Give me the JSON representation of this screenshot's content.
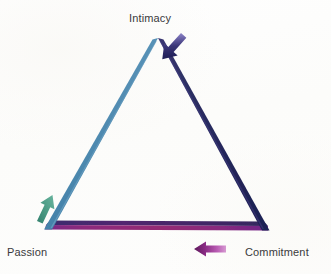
{
  "figure": {
    "background_color": "#fdfdfc",
    "label_color": "#3a3a3c"
  },
  "vertices": {
    "apex": {
      "label": "Intimacy",
      "x": 158,
      "y": 38
    },
    "bottom_left": {
      "label": "Passion",
      "x": 45,
      "y": 229
    },
    "bottom_right": {
      "label": "Commitment",
      "x": 268,
      "y": 230
    }
  },
  "labels": {
    "intimacy": "Intimacy",
    "passion": "Passion",
    "commitment": "Commitment"
  },
  "edges": [
    {
      "name": "intimacy-to-passion",
      "side": "left",
      "color_start": "#5a93b8",
      "color_end": "#3f7fa8",
      "description": "steel blue left edge"
    },
    {
      "name": "intimacy-to-commitment",
      "side": "right",
      "color_start": "#2c2f63",
      "color_end": "#1f2155",
      "description": "dark navy indigo right edge"
    },
    {
      "name": "passion-to-commitment",
      "side": "bottom",
      "color_start": "#8e2a78",
      "color_end": "#7b2d8a",
      "description": "magenta purple base bar"
    }
  ],
  "arrows": [
    {
      "name": "intimacy-to-commitment-arrow",
      "direction": "down-right",
      "color_start": "#8c86c4",
      "color_end": "#1c1c52",
      "accent": "#2a2a66"
    },
    {
      "name": "passion-to-intimacy-arrow",
      "direction": "up-right",
      "color_start": "#3f8f7d",
      "color_end": "#56a894",
      "accent": "#2f7d6b"
    },
    {
      "name": "commitment-to-passion-arrow",
      "direction": "left",
      "color_start": "#c76fc0",
      "color_end": "#6d1f6b",
      "accent": "#5e1a5c"
    }
  ]
}
